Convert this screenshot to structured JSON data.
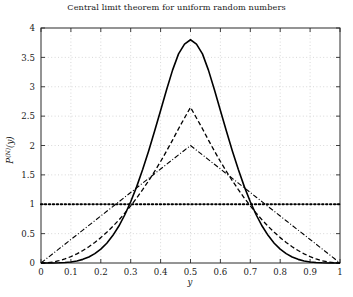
{
  "figure": {
    "title": "Central limit theorem for uniform random numbers",
    "background": "#ffffff",
    "foreground": "#1a1a1a"
  },
  "axes": {
    "xlabel": "y",
    "ylabel_base": "P",
    "ylabel_sup": "(N)",
    "ylabel_arg": "(y)",
    "xticks": [
      "0",
      "0.1",
      "0.2",
      "0.3",
      "0.4",
      "0.5",
      "0.6",
      "0.7",
      "0.8",
      "0.9",
      "1"
    ],
    "yticks": [
      "0",
      "0.5",
      "1",
      "1.5",
      "2",
      "2.5",
      "3",
      "3.5",
      "4"
    ],
    "xlim": [
      0,
      1
    ],
    "ylim": [
      0,
      4
    ],
    "grid": "dotted"
  },
  "chart_data": {
    "type": "line",
    "title": "Central limit theorem for uniform random numbers",
    "xlabel": "y",
    "ylabel": "P^(N)(y)",
    "xlim": [
      0,
      1
    ],
    "ylim": [
      0,
      4
    ],
    "grid": true,
    "legend": "none",
    "x": [
      0,
      0.02,
      0.04,
      0.06,
      0.08,
      0.1,
      0.12,
      0.14,
      0.16,
      0.18,
      0.2,
      0.22,
      0.24,
      0.26,
      0.28,
      0.3,
      0.32,
      0.34,
      0.36,
      0.38,
      0.4,
      0.42,
      0.44,
      0.46,
      0.48,
      0.5,
      0.52,
      0.54,
      0.56,
      0.58,
      0.6,
      0.62,
      0.64,
      0.66,
      0.68,
      0.7,
      0.72,
      0.74,
      0.76,
      0.78,
      0.8,
      0.82,
      0.84,
      0.86,
      0.88,
      0.9,
      0.92,
      0.94,
      0.96,
      0.98,
      1
    ],
    "series": [
      {
        "name": "N = 1",
        "style": "dotted",
        "linewidth": 2.2,
        "color": "#000000",
        "peak": 1.0,
        "values": [
          1,
          1,
          1,
          1,
          1,
          1,
          1,
          1,
          1,
          1,
          1,
          1,
          1,
          1,
          1,
          1,
          1,
          1,
          1,
          1,
          1,
          1,
          1,
          1,
          1,
          1,
          1,
          1,
          1,
          1,
          1,
          1,
          1,
          1,
          1,
          1,
          1,
          1,
          1,
          1,
          1,
          1,
          1,
          1,
          1,
          1,
          1,
          1,
          1,
          1,
          1
        ]
      },
      {
        "name": "N = 2",
        "style": "dashdot",
        "linewidth": 1.1,
        "color": "#000000",
        "peak": 2.0,
        "values": [
          0,
          0.08,
          0.16,
          0.24,
          0.32,
          0.4,
          0.48,
          0.56,
          0.64,
          0.72,
          0.8,
          0.88,
          0.96,
          1.04,
          1.12,
          1.2,
          1.28,
          1.36,
          1.44,
          1.52,
          1.6,
          1.68,
          1.76,
          1.84,
          1.92,
          2.0,
          1.92,
          1.84,
          1.76,
          1.68,
          1.6,
          1.52,
          1.44,
          1.36,
          1.28,
          1.2,
          1.12,
          1.04,
          0.96,
          0.88,
          0.8,
          0.72,
          0.64,
          0.56,
          0.48,
          0.4,
          0.32,
          0.24,
          0.16,
          0.08,
          0
        ]
      },
      {
        "name": "N = 3",
        "style": "dashed",
        "linewidth": 1.3,
        "color": "#000000",
        "peak": 2.65,
        "values": [
          0,
          0.004,
          0.017,
          0.039,
          0.069,
          0.108,
          0.156,
          0.212,
          0.276,
          0.35,
          0.432,
          0.523,
          0.622,
          0.73,
          0.847,
          0.972,
          1.106,
          1.249,
          1.4,
          1.56,
          1.728,
          1.906,
          2.092,
          2.286,
          2.469,
          2.65,
          2.469,
          2.286,
          2.092,
          1.906,
          1.728,
          1.56,
          1.4,
          1.249,
          1.106,
          0.972,
          0.847,
          0.73,
          0.622,
          0.523,
          0.432,
          0.35,
          0.276,
          0.212,
          0.156,
          0.108,
          0.069,
          0.039,
          0.017,
          0.004,
          0
        ]
      },
      {
        "name": "N = 6",
        "style": "solid",
        "linewidth": 1.6,
        "color": "#000000",
        "peak": 3.8,
        "values": [
          0,
          0.0001,
          0.0009,
          0.003,
          0.008,
          0.018,
          0.035,
          0.062,
          0.102,
          0.159,
          0.236,
          0.337,
          0.466,
          0.625,
          0.817,
          1.042,
          1.3,
          1.59,
          1.907,
          2.246,
          2.597,
          2.948,
          3.283,
          3.56,
          3.726,
          3.8,
          3.726,
          3.56,
          3.283,
          2.948,
          2.597,
          2.246,
          1.907,
          1.59,
          1.3,
          1.042,
          0.817,
          0.625,
          0.466,
          0.337,
          0.236,
          0.159,
          0.102,
          0.062,
          0.035,
          0.018,
          0.008,
          0.003,
          0.0009,
          0.0001,
          0
        ]
      }
    ],
    "annotations": [
      "Distributions of the mean of N uniform random numbers on [0,1]; as N grows the distribution narrows toward a Gaussian centered at 0.5."
    ]
  }
}
